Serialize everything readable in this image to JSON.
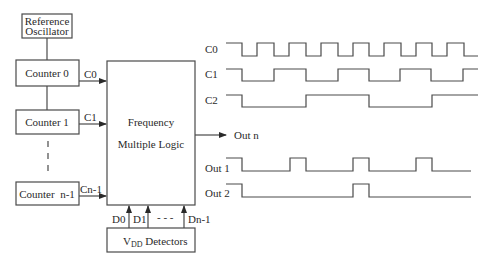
{
  "blocks": {
    "reference_oscillator": {
      "line1": "Reference",
      "line2": "Oscillator"
    },
    "counter0": "Counter 0",
    "counter1": "Counter 1",
    "counter_n1": "Counter  n-1",
    "logic": {
      "line1": "Frequency",
      "line2": "Multiple Logic"
    },
    "vdd": {
      "main": "V",
      "sub": "DD",
      "rest": " Detectors"
    }
  },
  "signals": {
    "c0": "C0",
    "c1": "C1",
    "cn1": "Cn-1",
    "d0": "D0",
    "d1": "D1",
    "dots": "- - -",
    "dn1": "Dn-1",
    "out_n": "Out n"
  },
  "waveforms": {
    "labels": [
      "C0",
      "C1",
      "C2",
      "Out 1",
      "Out 2"
    ],
    "c0_transitions": [
      226,
      242,
      257,
      274,
      289,
      306,
      321,
      338,
      353,
      369,
      384,
      401,
      416,
      432,
      447,
      464,
      478
    ],
    "c1_transitions": [
      226,
      242,
      274,
      306,
      338,
      369,
      400,
      431,
      463,
      478
    ],
    "c2_transitions": [
      226,
      242,
      306,
      369,
      432,
      478
    ],
    "out1_transitions": [
      226,
      242,
      290,
      306,
      353,
      369,
      416,
      432,
      471
    ],
    "out2_transitions": [
      226,
      242,
      353,
      369,
      471
    ]
  },
  "colors": {
    "line": "#4a4a4a",
    "text": "#2a2a2a",
    "background": "#ffffff"
  }
}
